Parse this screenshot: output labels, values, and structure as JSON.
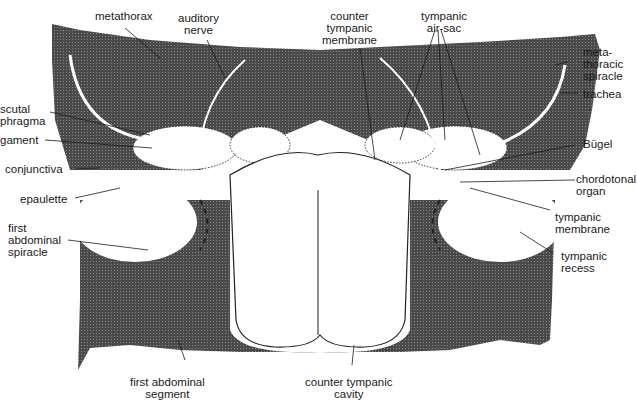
{
  "diagram": {
    "colors": {
      "tissue": "#3a3a3a",
      "cavity": "#ffffff",
      "line": "#1a1a1a"
    },
    "labels": {
      "metathorax": "metathorax",
      "auditory_nerve": "auditory\nnerve",
      "counter_tympanic_membrane": "counter\ntympanic\nmembrane",
      "tympanic_air_sac": "tympanic\nair-sac",
      "metathoracic_spiracle": "meta-\nthoracic\nspiracle",
      "trachea": "trachea",
      "scutal_phragma": "scutal\nphragma",
      "ligament": "gament",
      "bugel": "Bügel",
      "conjunctiva": "conjunctiva",
      "chordotonal_organ": "chordotonal\norgan",
      "epaulette": "epaulette",
      "tympanic_membrane": "tympanic\nmembrane",
      "first_abdominal_spiracle": "first\nabdominal\nspiracle",
      "tympanic_recess": "tympanic\nrecess",
      "first_abdominal_segment": "first abdominal\nsegment",
      "counter_tympanic_cavity": "counter tympanic\ncavity"
    }
  }
}
